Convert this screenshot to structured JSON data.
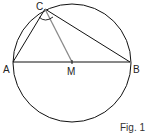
{
  "figure": {
    "caption": "Fig. 1",
    "points": {
      "A": {
        "label": "A"
      },
      "B": {
        "label": "B"
      },
      "C": {
        "label": "C"
      },
      "M": {
        "label": "M"
      }
    },
    "colors": {
      "stroke": "#111111",
      "median": "#8a8a8a"
    }
  }
}
